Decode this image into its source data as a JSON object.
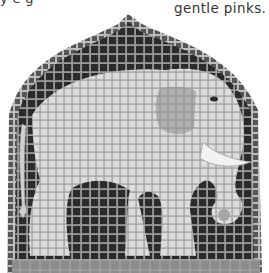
{
  "caption": {
    "top_left_fragment": "y      e       g",
    "top_right": "gentle pinks."
  },
  "artwork": {
    "subject": "elephant mosaic",
    "colors": {
      "background_tiles": "#2b2b2b",
      "border_tiles": "#6a6a6a",
      "elephant_tiles": "#d8d8d8",
      "ear_tiles": "#a9a9a9",
      "tusk_tiles": "#f0f0f0",
      "base_strip": "#8e8e8e",
      "grout": "#9a9a9a"
    }
  }
}
